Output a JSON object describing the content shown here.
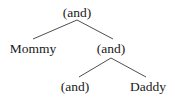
{
  "figure": {
    "type": "syntax-tree-diagram",
    "background_color": "#ffffff",
    "line_color": "#3a3a3a",
    "text_color": "#1a1a1a"
  },
  "nodes": {
    "root": {
      "label": "(and)",
      "x": 77,
      "y": 12
    },
    "mommy": {
      "label": "Mommy",
      "x": 33,
      "y": 48
    },
    "and_mid": {
      "label": "(and)",
      "x": 111,
      "y": 48
    },
    "and_low": {
      "label": "(and)",
      "x": 75,
      "y": 86
    },
    "daddy": {
      "label": "Daddy",
      "x": 148,
      "y": 86
    }
  },
  "edges": [
    {
      "from": "root",
      "to": "mommy",
      "x1": 77,
      "y1": 20,
      "x2": 33,
      "y2": 39
    },
    {
      "from": "root",
      "to": "and_mid",
      "x1": 77,
      "y1": 20,
      "x2": 113,
      "y2": 39
    },
    {
      "from": "and_mid",
      "to": "and_low",
      "x1": 111,
      "y1": 58,
      "x2": 79,
      "y2": 77
    },
    {
      "from": "and_mid",
      "to": "daddy",
      "x1": 111,
      "y1": 58,
      "x2": 146,
      "y2": 77
    }
  ]
}
